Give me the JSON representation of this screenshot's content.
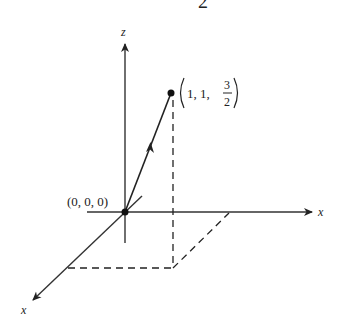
{
  "diagram": {
    "type": "3d-coordinate-vector",
    "top_fragment": "2",
    "axes": {
      "z_label": "z",
      "right_label": "x",
      "front_label": "x"
    },
    "origin": {
      "label": "(0, 0, 0)"
    },
    "point": {
      "label_prefix": "1, 1, ",
      "frac_num": "3",
      "frac_den": "2",
      "coordinates": [
        1,
        1,
        1.5
      ]
    },
    "colors": {
      "ink": "#222222",
      "background": "#ffffff"
    }
  }
}
